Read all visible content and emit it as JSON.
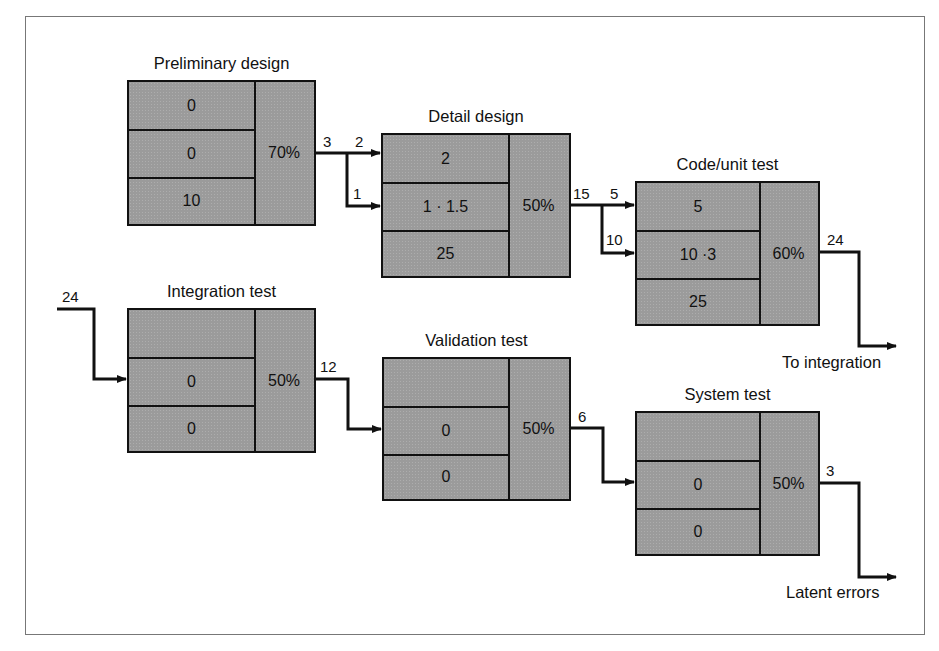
{
  "stages": [
    {
      "id": "preliminary",
      "title": "Preliminary design",
      "cells": [
        "0",
        "0",
        "10"
      ],
      "efficiency": "70%"
    },
    {
      "id": "detail",
      "title": "Detail design",
      "cells": [
        "2",
        "1 · 1.5",
        "25"
      ],
      "efficiency": "50%"
    },
    {
      "id": "code",
      "title": "Code/unit test",
      "cells": [
        "5",
        "10 ·3",
        "25"
      ],
      "efficiency": "60%"
    },
    {
      "id": "integration",
      "title": "Integration test",
      "cells": [
        "",
        "0",
        "0"
      ],
      "efficiency": "50%"
    },
    {
      "id": "validation",
      "title": "Validation test",
      "cells": [
        "",
        "0",
        "0"
      ],
      "efficiency": "50%"
    },
    {
      "id": "system",
      "title": "System test",
      "cells": [
        "",
        "0",
        "0"
      ],
      "efficiency": "50%"
    }
  ],
  "flows": {
    "prelim_out": "3",
    "detail_in_top": "2",
    "detail_in_mid": "1",
    "detail_out": "15",
    "code_in_top": "5",
    "code_in_mid": "10",
    "code_out": "24",
    "integration_in": "24",
    "integration_out": "12",
    "validation_out": "6",
    "system_out": "3"
  },
  "outputs": {
    "to_integration": "To integration",
    "latent_errors": "Latent errors"
  },
  "colors": {
    "box_fill": "#9b9b9b",
    "line": "#111111",
    "frame": "#777777"
  }
}
